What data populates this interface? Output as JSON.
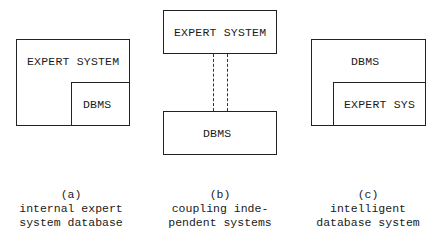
{
  "diagrams": {
    "a": {
      "outer_label": "EXPERT SYSTEM",
      "inner_label": "DBMS",
      "caption_letter": "(a)",
      "caption_line1": "internal expert",
      "caption_line2": "system database"
    },
    "b": {
      "top_label": "EXPERT SYSTEM",
      "bottom_label": "DBMS",
      "caption_letter": "(b)",
      "caption_line1": "coupling inde-",
      "caption_line2": "pendent systems"
    },
    "c": {
      "outer_label": "DBMS",
      "inner_label": "EXPERT SYS",
      "caption_letter": "(c)",
      "caption_line1": "intelligent",
      "caption_line2": "database system"
    }
  }
}
